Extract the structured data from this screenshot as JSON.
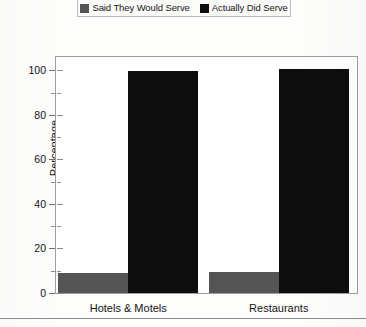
{
  "chart_data": {
    "type": "bar",
    "title": "",
    "subtitle": "",
    "xlabel": "",
    "ylabel": "Percentage",
    "categories": [
      "Hotels & Motels",
      "Restaurants"
    ],
    "series": [
      {
        "name": "Said They Would Serve",
        "color": "#555555",
        "values": [
          9,
          9.5
        ]
      },
      {
        "name": "Actually Did Serve",
        "color": "#0d0d0d",
        "values": [
          99.5,
          100.5
        ]
      }
    ],
    "ylim": [
      0,
      106
    ],
    "y_ticks": [
      0,
      20,
      40,
      60,
      80,
      100
    ],
    "y_tick_labels": [
      "0",
      "20",
      "40",
      "60",
      "80",
      "100"
    ],
    "y_minor_ticks": [
      10,
      30,
      50,
      70,
      90
    ],
    "grid": false,
    "legend_position": "top",
    "bar_grouping": "grouped",
    "frame": true
  },
  "legend": {
    "entries": [
      {
        "label": "Said They Would Serve",
        "color": "#555555"
      },
      {
        "label": "Actually Did Serve",
        "color": "#0d0d0d"
      }
    ]
  },
  "axes": {
    "y_title": "Percentage"
  }
}
